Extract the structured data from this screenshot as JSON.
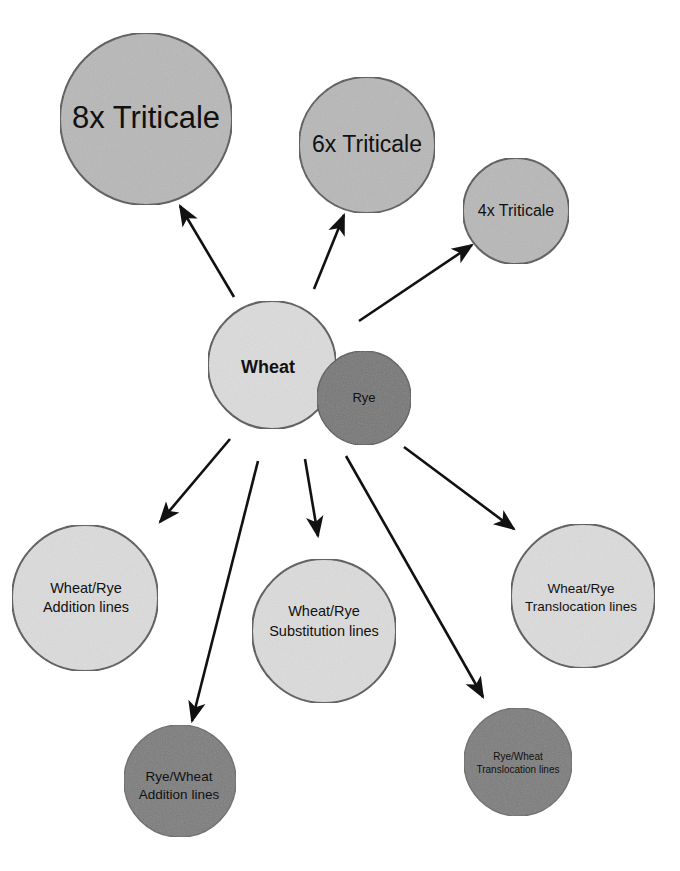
{
  "diagram": {
    "type": "radial-relationship",
    "colors": {
      "background": "#ffffff",
      "light_fill": "#d9d9d9",
      "medium_fill": "#b5b5b5",
      "dark_fill": "#7a7a7a",
      "stroke": "#555555",
      "arrow": "#111111"
    },
    "center": {
      "wheat": {
        "label": "Wheat"
      },
      "rye": {
        "label": "Rye"
      }
    },
    "nodes": {
      "triticale_8x": {
        "label": "8x Triticale"
      },
      "triticale_6x": {
        "label": "6x Triticale"
      },
      "triticale_4x": {
        "label": "4x Triticale"
      },
      "wr_addition": {
        "line1": "Wheat/Rye",
        "line2": "Addition lines"
      },
      "wr_substitution": {
        "line1": "Wheat/Rye",
        "line2": "Substitution lines"
      },
      "wr_translocation": {
        "line1": "Wheat/Rye",
        "line2": "Translocation lines"
      },
      "rw_addition": {
        "line1": "Rye/Wheat",
        "line2": "Addition lines"
      },
      "rw_translocation": {
        "line1": "Rye/Wheat",
        "line2": "Translocation lines"
      }
    },
    "edges": [
      {
        "from": "wheat",
        "to": "8x Triticale"
      },
      {
        "from": "wheat",
        "to": "6x Triticale"
      },
      {
        "from": "wheat",
        "to": "4x Triticale"
      },
      {
        "from": "wheat",
        "to": "Wheat/Rye Addition lines"
      },
      {
        "from": "wheat",
        "to": "Rye/Wheat Addition lines"
      },
      {
        "from": "wheat",
        "to": "Wheat/Rye Substitution lines"
      },
      {
        "from": "wheat",
        "to": "Rye/Wheat Translocation lines"
      },
      {
        "from": "wheat",
        "to": "Wheat/Rye Translocation lines"
      }
    ]
  }
}
